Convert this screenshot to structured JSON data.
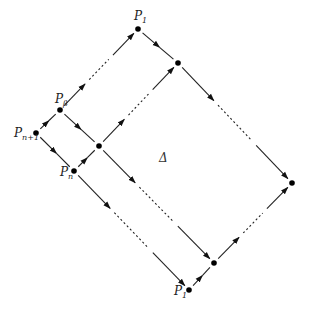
{
  "diagram": {
    "type": "directed-lattice",
    "region_label": "Δ",
    "nodes": [
      {
        "id": "P_n1",
        "label": "P",
        "sub": "n+1",
        "x": 36,
        "y": 133
      },
      {
        "id": "P_beta",
        "label": "P",
        "sub": "β",
        "x": 60,
        "y": 110
      },
      {
        "id": "P_n",
        "label": "P",
        "sub": "n",
        "x": 74,
        "y": 171
      },
      {
        "id": "P_1_top",
        "label": "P",
        "sub": "1",
        "x": 138,
        "y": 29
      },
      {
        "id": "Q",
        "label": "",
        "sub": "",
        "x": 99,
        "y": 146
      },
      {
        "id": "R",
        "label": "",
        "sub": "",
        "x": 178,
        "y": 63
      },
      {
        "id": "S",
        "label": "",
        "sub": "",
        "x": 292,
        "y": 183
      },
      {
        "id": "T",
        "label": "",
        "sub": "",
        "x": 214,
        "y": 263
      },
      {
        "id": "P_1_bottom",
        "label": "P",
        "sub": "1",
        "x": 189,
        "y": 290
      }
    ],
    "edges": [
      {
        "from": "P_n1",
        "to": "P_beta",
        "dashed_middle": false
      },
      {
        "from": "P_n1",
        "to": "P_n",
        "dashed_middle": false
      },
      {
        "from": "P_beta",
        "to": "P_1_top",
        "dashed_middle": true
      },
      {
        "from": "P_beta",
        "to": "Q",
        "dashed_middle": false
      },
      {
        "from": "P_n",
        "to": "Q",
        "dashed_middle": false
      },
      {
        "from": "P_1_top",
        "to": "R",
        "dashed_middle": false
      },
      {
        "from": "Q",
        "to": "R",
        "dashed_middle": true
      },
      {
        "from": "R",
        "to": "S",
        "dashed_middle": true
      },
      {
        "from": "Q",
        "to": "T",
        "dashed_middle": true
      },
      {
        "from": "P_n",
        "to": "P_1_bottom",
        "dashed_middle": true
      },
      {
        "from": "P_1_bottom",
        "to": "T",
        "dashed_middle": false
      },
      {
        "from": "T",
        "to": "S",
        "dashed_middle": true
      }
    ]
  },
  "labels": {
    "p_n1": {
      "main": "P",
      "sub": "n+1"
    },
    "p_beta": {
      "main": "P",
      "sub": "β"
    },
    "p_n": {
      "main": "P",
      "sub": "n"
    },
    "p_1_top": {
      "main": "P",
      "sub": "1"
    },
    "p_1_bottom": {
      "main": "P",
      "sub": "1"
    },
    "delta": "Δ"
  }
}
